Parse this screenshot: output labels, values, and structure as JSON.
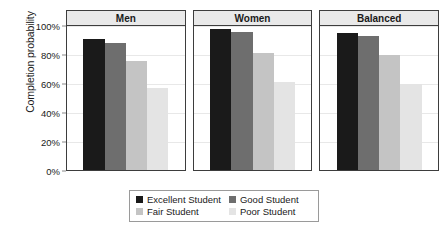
{
  "chart_data": {
    "type": "bar",
    "title": "",
    "xlabel": "",
    "ylabel": "Completion probability",
    "ylim": [
      0,
      100
    ],
    "ytick_labels": [
      "100%",
      "80%",
      "60%",
      "40%",
      "20%",
      "0%"
    ],
    "ytick_values": [
      100,
      80,
      60,
      40,
      20,
      0
    ],
    "grid": true,
    "legend_position": "bottom",
    "panels": [
      "Men",
      "Women",
      "Balanced"
    ],
    "categories": [
      "Excellent Student",
      "Good Student",
      "Fair Student",
      "Poor Student"
    ],
    "series": [
      {
        "name": "Men",
        "values": [
          91,
          88,
          76,
          57
        ]
      },
      {
        "name": "Women",
        "values": [
          98,
          96,
          81,
          61
        ]
      },
      {
        "name": "Balanced",
        "values": [
          95,
          93,
          80,
          60
        ]
      }
    ],
    "colors": [
      "#1a1a1a",
      "#6e6e6e",
      "#c4c4c4",
      "#e4e4e4"
    ]
  },
  "legend": {
    "items": [
      {
        "label": "Excellent Student",
        "color": "#1a1a1a"
      },
      {
        "label": "Good Student",
        "color": "#6e6e6e"
      },
      {
        "label": "Fair Student",
        "color": "#c4c4c4"
      },
      {
        "label": "Poor Student",
        "color": "#e4e4e4"
      }
    ]
  }
}
